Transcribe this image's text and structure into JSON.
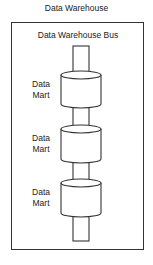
{
  "diagram": {
    "title": "Data Warehouse",
    "bus_label": "Data Warehouse Bus",
    "data_marts": [
      {
        "line1": "Data",
        "line2": "Mart"
      },
      {
        "line1": "Data",
        "line2": "Mart"
      },
      {
        "line1": "Data",
        "line2": "Mart"
      }
    ],
    "colors": {
      "stroke": "#333333",
      "fill": "#ffffff",
      "background": "#ffffff"
    }
  }
}
